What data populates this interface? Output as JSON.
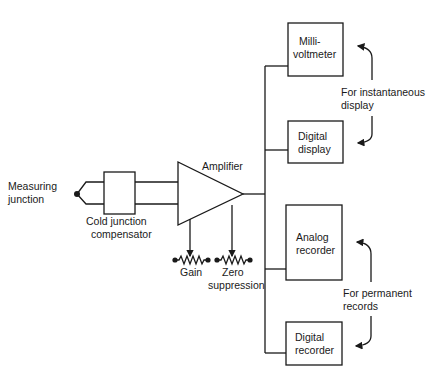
{
  "diagram": {
    "type": "thermocouple measurement block diagram",
    "input": {
      "label_line1": "Measuring",
      "label_line2": "junction"
    },
    "compensator": {
      "label_line1": "Cold junction",
      "label_line2": "compensator"
    },
    "amplifier": {
      "label": "Amplifier"
    },
    "controls": [
      {
        "id": "gain",
        "label_line1": "Gain",
        "label_line2": ""
      },
      {
        "id": "zero",
        "label_line1": "Zero",
        "label_line2": "suppression"
      }
    ],
    "outputs": [
      {
        "id": "millivoltmeter",
        "label_line1": "Milli-",
        "label_line2": "voltmeter"
      },
      {
        "id": "digital-display",
        "label_line1": "Digital",
        "label_line2": "display"
      },
      {
        "id": "analog-recorder",
        "label_line1": "Analog",
        "label_line2": "recorder"
      },
      {
        "id": "digital-recorder",
        "label_line1": "Digital",
        "label_line2": "recorder"
      }
    ],
    "groups": [
      {
        "id": "instantaneous",
        "label_line1": "For instantaneous",
        "label_line2": "display"
      },
      {
        "id": "permanent",
        "label_line1": "For permanent",
        "label_line2": "records"
      }
    ]
  }
}
